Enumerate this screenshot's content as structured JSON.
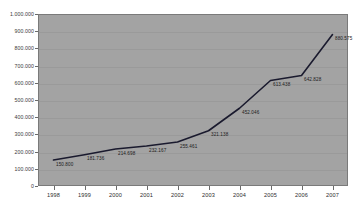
{
  "chart_data": {
    "type": "line",
    "title": "",
    "xlabel": "",
    "ylabel": "",
    "grid": true,
    "legend": "none",
    "ylim": [
      0,
      1000000
    ],
    "ytick_step": 100000,
    "categories": [
      "1998",
      "1999",
      "2000",
      "2001",
      "2002",
      "2003",
      "2004",
      "2005",
      "2006",
      "2007"
    ],
    "values": [
      150800,
      181736,
      214698,
      232167,
      255461,
      321138,
      452046,
      613438,
      642828,
      880575
    ],
    "value_labels": [
      "150.800",
      "181.736",
      "214.698",
      "232.167",
      "255.461",
      "321.138",
      "452.046",
      "613.438",
      "642.828",
      "880.575"
    ],
    "ytick_labels": [
      "1.000.000",
      "900.000",
      "800.000",
      "700.000",
      "600.000",
      "500.000",
      "400.000",
      "300.000",
      "200.000",
      "100.000",
      "0"
    ],
    "series": [
      {
        "name": "series-1",
        "color": "#1a1a2e",
        "values": [
          150800,
          181736,
          214698,
          232167,
          255461,
          321138,
          452046,
          613438,
          642828,
          880575
        ]
      }
    ],
    "plot_background": "#a3a3a3",
    "page_background": "#ffffff",
    "line_color": "#1a1a2e",
    "gridline_color": "#9a9a9a"
  },
  "decor": {
    "title_sliver": "",
    "corner_mark": ""
  }
}
